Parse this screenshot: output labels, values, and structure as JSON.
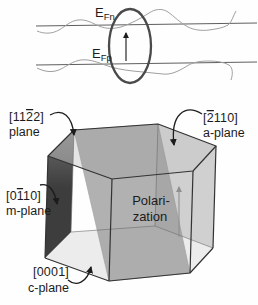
{
  "figure": {
    "band_diagram": {
      "efn_main": "E",
      "efn_sub": "Fn",
      "efp_main": "E",
      "efp_sub": "Fp"
    },
    "crystal": {
      "semipolar_plane": {
        "miller_pre": "[11",
        "miller_bar": "2",
        "miller_post": "2]",
        "caption": "plane"
      },
      "a_plane": {
        "miller_pre": "[",
        "miller_bar": "2",
        "miller_post": "110]",
        "caption": "a-plane"
      },
      "m_plane": {
        "miller_pre": "[0",
        "miller_bar": "1",
        "miller_post": "10]",
        "caption": "m-plane"
      },
      "c_plane": {
        "miller_pre": "",
        "miller_bar": "",
        "miller_post": "[0001]",
        "caption": "c-plane"
      },
      "polarization_line1": "Polari-",
      "polarization_line2": "zation"
    },
    "colors": {
      "ellipse_stroke": "#4a4a4a",
      "m_plane_dark": "#3d3d3d",
      "m_plane_light": "#6f6f6f",
      "tilted_plane_fill": "#9c9c9c",
      "a_plane_fill": "#c9c9c9",
      "c_plane_fill": "#ececec",
      "top_face_fill": "#c8c8c8",
      "polarization_gray": "#8f8f8f",
      "wavy_gray": "#a0a0a0"
    }
  }
}
